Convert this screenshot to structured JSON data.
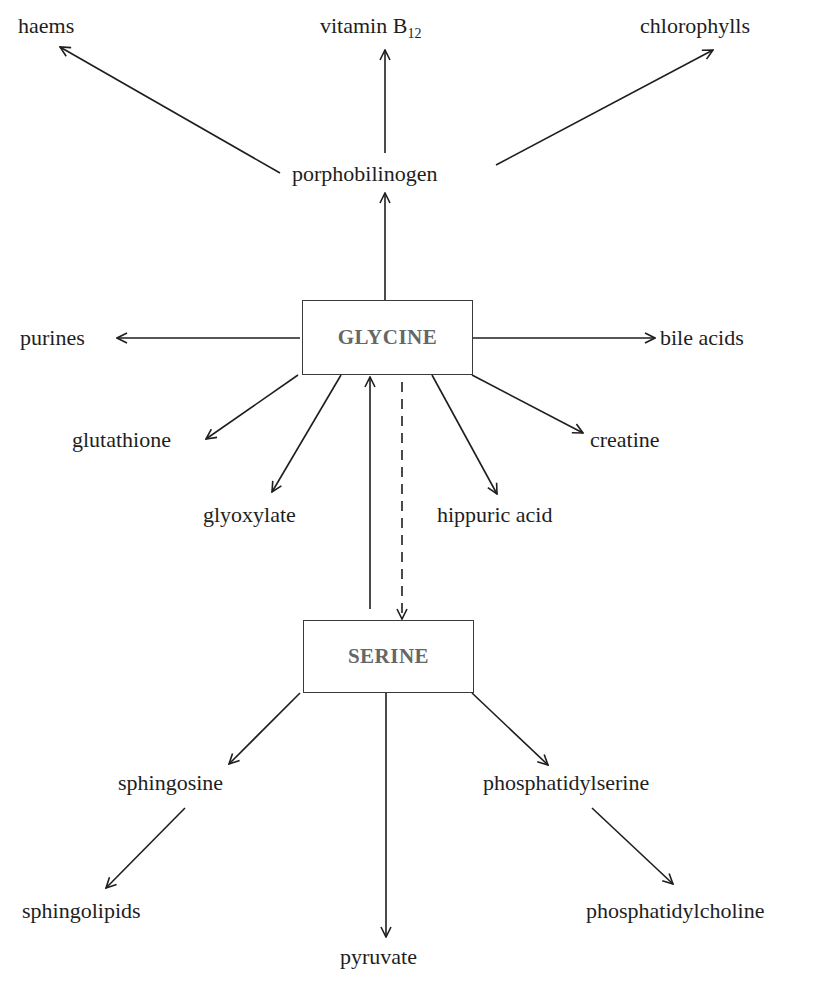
{
  "diagram": {
    "colors": {
      "line": "#1e1e1e",
      "box_border": "#3a3a3a",
      "box_text": "#666666",
      "label_text": "#1e1e1e"
    },
    "nodes": {
      "glycine": {
        "label": "GLYCINE",
        "type": "box"
      },
      "serine": {
        "label": "SERINE",
        "type": "box"
      },
      "porphobilinogen": {
        "label": "porphobilinogen"
      },
      "haems": {
        "label": "haems"
      },
      "vitamin_b12": {
        "label": "vitamin B",
        "subscript": "12"
      },
      "chlorophylls": {
        "label": "chlorophylls"
      },
      "purines": {
        "label": "purines"
      },
      "bile_acids": {
        "label": "bile acids"
      },
      "glutathione": {
        "label": "glutathione"
      },
      "glyoxylate": {
        "label": "glyoxylate"
      },
      "hippuric_acid": {
        "label": "hippuric acid"
      },
      "creatine": {
        "label": "creatine"
      },
      "sphingosine": {
        "label": "sphingosine"
      },
      "sphingolipids": {
        "label": "sphingolipids"
      },
      "pyruvate": {
        "label": "pyruvate"
      },
      "phosphatidylserine": {
        "label": "phosphatidylserine"
      },
      "phosphatidylcholine": {
        "label": "phosphatidylcholine"
      }
    },
    "edges": [
      {
        "from": "glycine",
        "to": "porphobilinogen",
        "style": "solid"
      },
      {
        "from": "porphobilinogen",
        "to": "haems",
        "style": "solid"
      },
      {
        "from": "porphobilinogen",
        "to": "vitamin_b12",
        "style": "solid"
      },
      {
        "from": "porphobilinogen",
        "to": "chlorophylls",
        "style": "solid"
      },
      {
        "from": "glycine",
        "to": "purines",
        "style": "solid"
      },
      {
        "from": "glycine",
        "to": "bile_acids",
        "style": "solid"
      },
      {
        "from": "glycine",
        "to": "glutathione",
        "style": "solid"
      },
      {
        "from": "glycine",
        "to": "glyoxylate",
        "style": "solid"
      },
      {
        "from": "glycine",
        "to": "hippuric_acid",
        "style": "solid"
      },
      {
        "from": "glycine",
        "to": "creatine",
        "style": "solid"
      },
      {
        "from": "serine",
        "to": "glycine",
        "style": "solid"
      },
      {
        "from": "glycine",
        "to": "serine",
        "style": "dashed"
      },
      {
        "from": "serine",
        "to": "sphingosine",
        "style": "solid"
      },
      {
        "from": "sphingosine",
        "to": "sphingolipids",
        "style": "solid"
      },
      {
        "from": "serine",
        "to": "pyruvate",
        "style": "solid"
      },
      {
        "from": "serine",
        "to": "phosphatidylserine",
        "style": "solid"
      },
      {
        "from": "phosphatidylserine",
        "to": "phosphatidylcholine",
        "style": "solid"
      }
    ]
  }
}
